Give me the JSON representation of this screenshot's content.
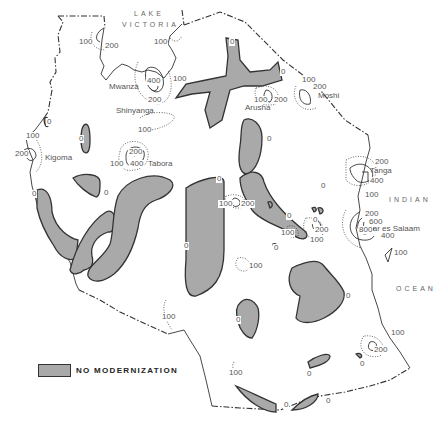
{
  "map": {
    "title": "",
    "fill_color": "#a9a9a9",
    "outline_color": "#333333",
    "background": "#ffffff"
  },
  "water_bodies": {
    "lake_line1": "LAKE",
    "lake_line2": "VICTORIA",
    "ocean_line1": "INDIAN",
    "ocean_line2": "OCEAN"
  },
  "cities": {
    "mwanza": "Mwanza",
    "shinyanga": "Shinyanga",
    "arusha": "Arusha",
    "moshi": "Moshi",
    "kigoma": "Kigoma",
    "tabora": "Tabora",
    "tanga": "Tanga",
    "dar": "Dar es Salaam"
  },
  "contour_labels": [
    {
      "text": "100",
      "x": 78,
      "y": 38
    },
    {
      "text": "200",
      "x": 104,
      "y": 42
    },
    {
      "text": "100",
      "x": 153,
      "y": 38
    },
    {
      "text": "400",
      "x": 146,
      "y": 77
    },
    {
      "text": "100",
      "x": 172,
      "y": 75
    },
    {
      "text": "200",
      "x": 147,
      "y": 96
    },
    {
      "text": "100",
      "x": 137,
      "y": 126
    },
    {
      "text": "0",
      "x": 229,
      "y": 38
    },
    {
      "text": "0",
      "x": 280,
      "y": 68
    },
    {
      "text": "100",
      "x": 301,
      "y": 76
    },
    {
      "text": "200",
      "x": 312,
      "y": 83
    },
    {
      "text": "100",
      "x": 253,
      "y": 96
    },
    {
      "text": "200",
      "x": 273,
      "y": 96
    },
    {
      "text": "0",
      "x": 266,
      "y": 135
    },
    {
      "text": "0",
      "x": 46,
      "y": 118
    },
    {
      "text": "100",
      "x": 25,
      "y": 132
    },
    {
      "text": "200",
      "x": 14,
      "y": 150
    },
    {
      "text": "0",
      "x": 78,
      "y": 135
    },
    {
      "text": "200",
      "x": 128,
      "y": 148
    },
    {
      "text": "100",
      "x": 109,
      "y": 160
    },
    {
      "text": "400",
      "x": 129,
      "y": 160
    },
    {
      "text": "0",
      "x": 31,
      "y": 190
    },
    {
      "text": "0",
      "x": 103,
      "y": 189
    },
    {
      "text": "200",
      "x": 374,
      "y": 158
    },
    {
      "text": "400",
      "x": 369,
      "y": 177
    },
    {
      "text": "100",
      "x": 364,
      "y": 191
    },
    {
      "text": "0",
      "x": 216,
      "y": 175
    },
    {
      "text": "100",
      "x": 218,
      "y": 200
    },
    {
      "text": "200",
      "x": 240,
      "y": 200
    },
    {
      "text": "0",
      "x": 320,
      "y": 182
    },
    {
      "text": "0",
      "x": 286,
      "y": 212
    },
    {
      "text": "200",
      "x": 364,
      "y": 210
    },
    {
      "text": "600",
      "x": 368,
      "y": 218
    },
    {
      "text": "800",
      "x": 358,
      "y": 226
    },
    {
      "text": "400",
      "x": 380,
      "y": 232
    },
    {
      "text": "100",
      "x": 393,
      "y": 249
    },
    {
      "text": "0",
      "x": 183,
      "y": 242
    },
    {
      "text": "100",
      "x": 280,
      "y": 229
    },
    {
      "text": "200",
      "x": 314,
      "y": 226
    },
    {
      "text": "100",
      "x": 309,
      "y": 236
    },
    {
      "text": "0",
      "x": 273,
      "y": 244
    },
    {
      "text": "0",
      "x": 312,
      "y": 216
    },
    {
      "text": "100",
      "x": 248,
      "y": 262
    },
    {
      "text": "0",
      "x": 345,
      "y": 292
    },
    {
      "text": "0",
      "x": 235,
      "y": 316
    },
    {
      "text": "100",
      "x": 390,
      "y": 329
    },
    {
      "text": "200",
      "x": 373,
      "y": 346
    },
    {
      "text": "0",
      "x": 359,
      "y": 360
    },
    {
      "text": "100",
      "x": 161,
      "y": 313
    },
    {
      "text": "100",
      "x": 228,
      "y": 369
    },
    {
      "text": "0",
      "x": 306,
      "y": 370
    },
    {
      "text": "0",
      "x": 283,
      "y": 401
    },
    {
      "text": "0",
      "x": 325,
      "y": 397
    }
  ],
  "legend": {
    "label": "NO MODERNIZATION"
  }
}
